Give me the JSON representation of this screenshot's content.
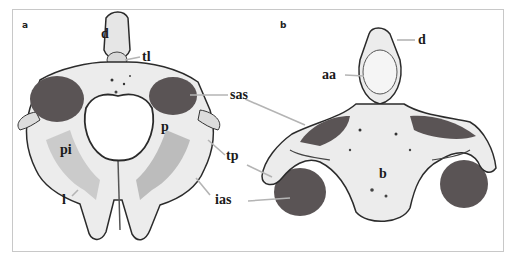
{
  "figure": {
    "panels": [
      {
        "letter": "a",
        "labels": {
          "d": "d",
          "tl": "tl",
          "sas": "sas",
          "p": "p",
          "pi": "pi",
          "tp": "tp",
          "l": "l",
          "ias": "ias"
        }
      },
      {
        "letter": "b",
        "labels": {
          "d": "d",
          "aa": "aa",
          "b": "b"
        }
      }
    ],
    "colors": {
      "facet_fill": "#5a5455",
      "bone_light": "#efefef",
      "bone_shade": "#9a9a9a",
      "bone_dark": "#2b2b2b",
      "leader_line": "#b4b4b4",
      "frame_border": "#c8c8c8"
    }
  }
}
